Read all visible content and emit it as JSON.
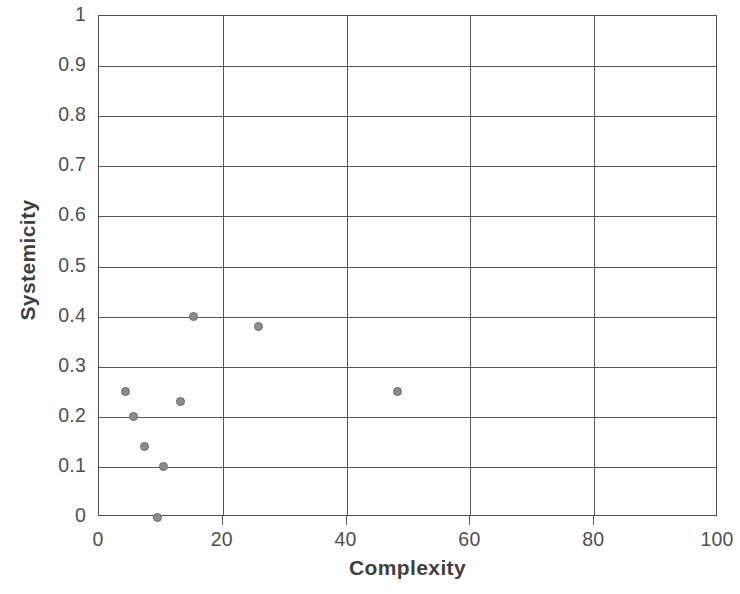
{
  "chart_data": {
    "type": "scatter",
    "title": "",
    "xlabel": "Complexity",
    "ylabel": "Systemicity",
    "xlim": [
      0,
      100
    ],
    "ylim": [
      0,
      1
    ],
    "grid": true,
    "legend": "none",
    "x_ticks": [
      "0",
      "20",
      "40",
      "60",
      "80",
      "100"
    ],
    "x_tick_values": [
      0,
      20,
      40,
      60,
      80,
      100
    ],
    "y_ticks": [
      "0",
      "0.1",
      "0.2",
      "0.3",
      "0.4",
      "0.5",
      "0.6",
      "0.7",
      "0.8",
      "0.9",
      "1"
    ],
    "y_tick_values": [
      0,
      0.1,
      0.2,
      0.3,
      0.4,
      0.5,
      0.6,
      0.7,
      0.8,
      0.9,
      1
    ],
    "marker_color": "#8c8c8c",
    "marker_edge_color": "#6b6b6b",
    "grid_color": "#565656",
    "points": [
      {
        "x": 4.3,
        "y": 0.25
      },
      {
        "x": 5.5,
        "y": 0.2
      },
      {
        "x": 7.4,
        "y": 0.14
      },
      {
        "x": 9.5,
        "y": 0.0
      },
      {
        "x": 10.5,
        "y": 0.1
      },
      {
        "x": 13.2,
        "y": 0.23
      },
      {
        "x": 15.2,
        "y": 0.4
      },
      {
        "x": 25.8,
        "y": 0.38
      },
      {
        "x": 48.3,
        "y": 0.25
      }
    ]
  }
}
